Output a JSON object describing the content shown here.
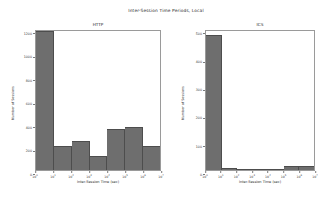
{
  "figure": {
    "suptitle": "Inter-Session Time Periods, Local",
    "background": "#ffffff",
    "bar_color": "#6e6e6e",
    "edge_color": "#4d4d4d",
    "axis_color": "#9a9a9a"
  },
  "chart_data": [
    {
      "type": "bar",
      "title": "HTTP",
      "xlabel": "Inter-Session Time (sec)",
      "ylabel": "Number of Sessions",
      "categories": [
        "10^0",
        "10^1",
        "10^2",
        "10^3",
        "10^4",
        "10^5",
        "10^6",
        "10^7"
      ],
      "xtick_labels": [
        "10",
        "10",
        "10",
        "10",
        "10",
        "10",
        "10",
        "10"
      ],
      "xtick_exponents": [
        "0",
        "1",
        "2",
        "3",
        "4",
        "5",
        "6",
        "7"
      ],
      "xscale": "log",
      "values": [
        1180,
        205,
        250,
        120,
        345,
        370,
        205
      ],
      "bar_count": 7,
      "ylim": [
        0,
        1200
      ],
      "ytick_values": [
        0,
        200,
        400,
        600,
        800,
        1000,
        1200
      ],
      "ytick_labels": [
        "0",
        "200",
        "400",
        "600",
        "800",
        "1000",
        "1200"
      ],
      "grid": false,
      "legend": false
    },
    {
      "type": "bar",
      "title": "ICS",
      "xlabel": "Inter-Session Time (sec)",
      "ylabel": "Number of Sessions",
      "categories": [
        "10^0",
        "10^1",
        "10^2",
        "10^3",
        "10^4",
        "10^5",
        "10^6",
        "10^7"
      ],
      "xtick_labels": [
        "10",
        "10",
        "10",
        "10",
        "10",
        "10",
        "10",
        "10"
      ],
      "xtick_exponents": [
        "0",
        "1",
        "2",
        "3",
        "4",
        "5",
        "6",
        "7"
      ],
      "xscale": "log",
      "values": [
        480,
        8,
        3,
        4,
        2,
        14,
        14
      ],
      "bar_count": 7,
      "ylim": [
        0,
        500
      ],
      "ytick_values": [
        0,
        100,
        200,
        300,
        400,
        500
      ],
      "ytick_labels": [
        "0",
        "100",
        "200",
        "300",
        "400",
        "500"
      ],
      "grid": false,
      "legend": false
    }
  ]
}
